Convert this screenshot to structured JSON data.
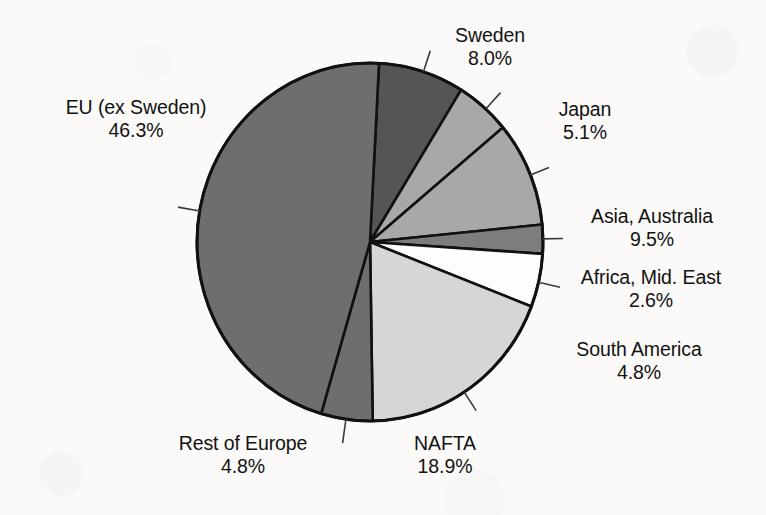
{
  "chart_data": {
    "type": "pie",
    "title": "",
    "subtitle": "",
    "xlabel": "",
    "ylabel": "",
    "legend_position": "none",
    "grid": false,
    "value_unit": "%",
    "total": 100.0,
    "categories": [
      "Sweden",
      "Japan",
      "Asia, Australia",
      "Africa, Mid. East",
      "South America",
      "NAFTA",
      "Rest of Europe",
      "EU (ex Sweden)"
    ],
    "values": [
      8.0,
      5.1,
      9.5,
      2.6,
      4.8,
      18.9,
      4.8,
      46.3
    ],
    "slices": [
      {
        "label": "Sweden",
        "value": 8.0,
        "value_text": "8.0%",
        "color": "#555555",
        "start_angle": 3,
        "end_angle": 31.8
      },
      {
        "label": "Japan",
        "value": 5.1,
        "value_text": "5.1%",
        "color": "#a8a8a8",
        "start_angle": 31.8,
        "end_angle": 50.2
      },
      {
        "label": "Asia, Australia",
        "value": 9.5,
        "value_text": "9.5%",
        "color": "#a8a8a8",
        "start_angle": 50.2,
        "end_angle": 84.4
      },
      {
        "label": "Africa, Mid. East",
        "value": 2.6,
        "value_text": "2.6%",
        "color": "#7d7d7d",
        "start_angle": 84.4,
        "end_angle": 93.8
      },
      {
        "label": "South America",
        "value": 4.8,
        "value_text": "4.8%",
        "color": "#fdfdfd",
        "start_angle": 93.8,
        "end_angle": 111.1
      },
      {
        "label": "NAFTA",
        "value": 18.9,
        "value_text": "18.9%",
        "color": "#d6d6d6",
        "start_angle": 111.1,
        "end_angle": 179.1
      },
      {
        "label": "Rest of Europe",
        "value": 4.8,
        "value_text": "4.8%",
        "color": "#6e6e6e",
        "start_angle": 179.1,
        "end_angle": 196.4
      },
      {
        "label": "EU (ex Sweden)",
        "value": 46.3,
        "value_text": "46.3%",
        "color": "#6e6e6e",
        "start_angle": 196.4,
        "end_angle": 363
      }
    ]
  },
  "labels": {
    "eu": {
      "name": "EU (ex Sweden)",
      "value": "46.3%"
    },
    "sweden": {
      "name": "Sweden",
      "value": "8.0%"
    },
    "japan": {
      "name": "Japan",
      "value": "5.1%"
    },
    "asia": {
      "name": "Asia, Australia",
      "value": "9.5%"
    },
    "africa": {
      "name": "Africa, Mid. East",
      "value": "2.6%"
    },
    "south_america": {
      "name": "South America",
      "value": "4.8%"
    },
    "nafta": {
      "name": "NAFTA",
      "value": "18.9%"
    },
    "rest_of_europe": {
      "name": "Rest of Europe",
      "value": "4.8%"
    }
  },
  "style": {
    "background": "#fbfaf8",
    "outline": "#111111",
    "text": "#121212"
  }
}
